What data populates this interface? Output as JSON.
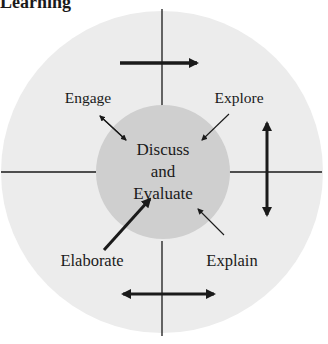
{
  "title": "Learning",
  "center": {
    "lines": [
      "Discuss",
      "and",
      "Evaluate"
    ]
  },
  "phases": [
    {
      "id": "engage",
      "label": "Engage"
    },
    {
      "id": "explore",
      "label": "Explore"
    },
    {
      "id": "explain",
      "label": "Explain"
    },
    {
      "id": "elaborate",
      "label": "Elaborate"
    }
  ],
  "colors": {
    "outer_circle": "#ececec",
    "inner_circle": "#cfcfcf",
    "lines": "#1a1a1a"
  },
  "arrows": [
    {
      "id": "top-arrow",
      "direction": "right"
    },
    {
      "id": "right-arrow",
      "direction": "up-down"
    },
    {
      "id": "bottom-arrow",
      "direction": "left-right"
    }
  ]
}
